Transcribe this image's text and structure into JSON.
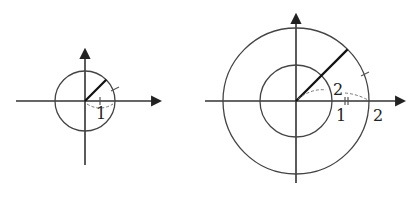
{
  "figure": {
    "colors": {
      "stroke": "#333333",
      "background": "#ffffff",
      "dashed": "#777777"
    },
    "left_diagram": {
      "center": [
        85,
        101
      ],
      "radius": 30,
      "radius_label": "1",
      "arc_label": "1",
      "angle_deg": 45
    },
    "right_diagram": {
      "center": [
        296,
        101
      ],
      "inner_radius": 36,
      "outer_radius": 73,
      "inner_radius_label": "1",
      "outer_radius_label": "2",
      "arc_label": "2",
      "angle_deg": 45
    }
  }
}
